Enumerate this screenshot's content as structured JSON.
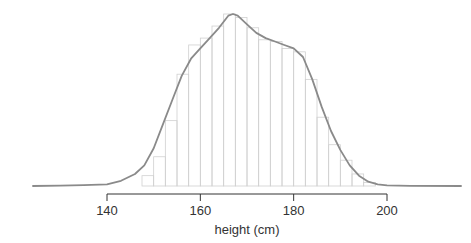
{
  "chart_data": {
    "type": "bar",
    "subtype": "histogram_with_density_curve",
    "title": "",
    "xlabel": "height (cm)",
    "ylabel": "",
    "xlim": [
      124,
      216
    ],
    "x_ticks": [
      140,
      160,
      180,
      200
    ],
    "x_tick_labels": [
      "140",
      "160",
      "180",
      "200"
    ],
    "grid": false,
    "legend": null,
    "bin_width": 2.5,
    "bins": [
      {
        "start": 147.5,
        "end": 150.0,
        "value": 0.06
      },
      {
        "start": 150.0,
        "end": 152.5,
        "value": 0.17
      },
      {
        "start": 152.5,
        "end": 155.0,
        "value": 0.38
      },
      {
        "start": 155.0,
        "end": 157.5,
        "value": 0.65
      },
      {
        "start": 157.5,
        "end": 160.0,
        "value": 0.82
      },
      {
        "start": 160.0,
        "end": 162.5,
        "value": 0.86
      },
      {
        "start": 162.5,
        "end": 165.0,
        "value": 0.93
      },
      {
        "start": 165.0,
        "end": 167.5,
        "value": 1.0
      },
      {
        "start": 167.5,
        "end": 170.0,
        "value": 0.98
      },
      {
        "start": 170.0,
        "end": 172.5,
        "value": 0.92
      },
      {
        "start": 172.5,
        "end": 175.0,
        "value": 0.85
      },
      {
        "start": 175.0,
        "end": 177.5,
        "value": 0.84
      },
      {
        "start": 177.5,
        "end": 180.0,
        "value": 0.8
      },
      {
        "start": 180.0,
        "end": 182.5,
        "value": 0.78
      },
      {
        "start": 182.5,
        "end": 185.0,
        "value": 0.62
      },
      {
        "start": 185.0,
        "end": 187.5,
        "value": 0.4
      },
      {
        "start": 187.5,
        "end": 190.0,
        "value": 0.24
      },
      {
        "start": 190.0,
        "end": 192.5,
        "value": 0.15
      },
      {
        "start": 192.5,
        "end": 195.0,
        "value": 0.07
      },
      {
        "start": 195.0,
        "end": 197.5,
        "value": 0.02
      }
    ],
    "density_curve": {
      "x": [
        124,
        130,
        135,
        140,
        143,
        146,
        148,
        150,
        152,
        154,
        156,
        158,
        160,
        162,
        164,
        166,
        167,
        168,
        170,
        172,
        174,
        176,
        178,
        180,
        182,
        184,
        186,
        188,
        190,
        192,
        194,
        196,
        198,
        200,
        205,
        216
      ],
      "y": [
        0.0,
        0.002,
        0.005,
        0.01,
        0.03,
        0.07,
        0.12,
        0.22,
        0.36,
        0.5,
        0.64,
        0.74,
        0.8,
        0.86,
        0.92,
        0.99,
        1.0,
        0.99,
        0.94,
        0.89,
        0.86,
        0.84,
        0.82,
        0.8,
        0.75,
        0.62,
        0.46,
        0.32,
        0.21,
        0.12,
        0.06,
        0.025,
        0.01,
        0.004,
        0.001,
        0.0
      ]
    },
    "colors": {
      "bar_outline": "#d0d0d0",
      "curve": "#8a8a8a",
      "axis": "#333333"
    }
  }
}
